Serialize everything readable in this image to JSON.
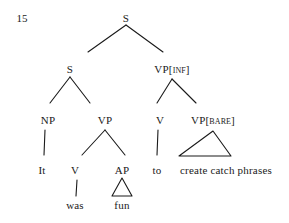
{
  "figure": {
    "example_number": "15",
    "type": "syntax-tree",
    "sentence": "It was fun to create catch phrases",
    "line_color": "#1a1a1a",
    "text_color": "#1a1a1a",
    "background": "#ffffff"
  },
  "nodes": {
    "root_s": {
      "label": "S",
      "x": 126,
      "y": 18
    },
    "embedded_s": {
      "label": "S",
      "x": 70,
      "y": 69
    },
    "vp_inf": {
      "cat": "VP",
      "bracket_open": "[",
      "feature": "INF",
      "bracket_close": "]",
      "x": 172,
      "y": 69
    },
    "np": {
      "label": "NP",
      "x": 48,
      "y": 120
    },
    "vp": {
      "label": "VP",
      "x": 105,
      "y": 120
    },
    "v_to": {
      "label": "V",
      "x": 160,
      "y": 120
    },
    "vp_bare": {
      "cat": "VP",
      "bracket_open": "[",
      "feature": "BARE",
      "bracket_close": "]",
      "x": 213,
      "y": 120
    },
    "v_was": {
      "label": "V",
      "x": 75,
      "y": 170
    },
    "ap": {
      "label": "AP",
      "x": 122,
      "y": 170
    }
  },
  "terminals": {
    "it": {
      "label": "It",
      "x": 42,
      "y": 170
    },
    "was": {
      "label": "was",
      "x": 75,
      "y": 205
    },
    "fun": {
      "label": "fun",
      "x": 122,
      "y": 205
    },
    "to": {
      "label": "to",
      "x": 157,
      "y": 170
    },
    "create_catch_phrases": {
      "label": "create catch phrases",
      "x": 226,
      "y": 170
    }
  },
  "triangles": {
    "vp_bare_triangle": {
      "apex_x": 213,
      "apex_y": 131,
      "left_x": 179,
      "right_x": 231,
      "base_y": 156
    },
    "ap_triangle": {
      "apex_x": 122,
      "apex_y": 178,
      "left_x": 112,
      "right_x": 132,
      "base_y": 196
    }
  },
  "edges": [
    {
      "name": "root-s-to-embedded-s",
      "x1": 126,
      "y1": 25,
      "x2": 88,
      "y2": 52
    },
    {
      "name": "root-s-to-vp-inf",
      "x1": 126,
      "y1": 25,
      "x2": 163,
      "y2": 52
    },
    {
      "name": "embedded-s-to-np",
      "x1": 70,
      "y1": 77,
      "x2": 50,
      "y2": 103
    },
    {
      "name": "embedded-s-to-vp",
      "x1": 70,
      "y1": 77,
      "x2": 90,
      "y2": 103
    },
    {
      "name": "vp-inf-to-v",
      "x1": 172,
      "y1": 79,
      "x2": 157,
      "y2": 103
    },
    {
      "name": "vp-inf-to-vp-bare",
      "x1": 172,
      "y1": 79,
      "x2": 196,
      "y2": 103
    },
    {
      "name": "np-to-it",
      "x1": 45,
      "y1": 130,
      "x2": 44,
      "y2": 155
    },
    {
      "name": "vp-to-v",
      "x1": 105,
      "y1": 130,
      "x2": 82,
      "y2": 155
    },
    {
      "name": "vp-to-ap",
      "x1": 105,
      "y1": 130,
      "x2": 125,
      "y2": 155
    },
    {
      "name": "v-to-to",
      "x1": 158,
      "y1": 130,
      "x2": 157,
      "y2": 155
    },
    {
      "name": "v-to-was",
      "x1": 77,
      "y1": 180,
      "x2": 76,
      "y2": 196
    }
  ]
}
